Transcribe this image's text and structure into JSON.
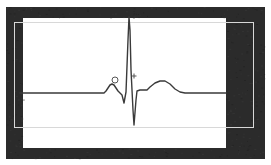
{
  "display": {
    "title": "ECG Waveform Trace",
    "width": 271,
    "height": 165,
    "background_color": "#ffffff",
    "frame_color": "#2b2b2b",
    "guide_color": "#d8d8d8",
    "trace_color": "#3a3a3a",
    "marker_color": "#555555"
  },
  "frame": {
    "name": "dark-border-frame",
    "outer_rect": {
      "x": 6,
      "y": 7,
      "width": 259,
      "height": 152
    },
    "top_bar_thickness": 11,
    "bottom_bar_thickness": 11,
    "left_bar_thickness": 17,
    "right_bar_thickness": 39
  },
  "guide_rect": {
    "name": "inner-guide-rectangle",
    "x": 14,
    "y": 22,
    "width": 239,
    "height": 105,
    "stroke_width": 1
  },
  "markers": [
    {
      "name": "circle-marker",
      "symbol": "circle",
      "x": 115,
      "y": 80,
      "radius": 3
    },
    {
      "name": "plus-marker",
      "symbol": "plus",
      "x": 134,
      "y": 76,
      "size": 5
    }
  ],
  "chart_data": {
    "type": "line",
    "title": "ECG Waveform Trace",
    "subtitle": "Single PQRST complex",
    "xlabel": "",
    "ylabel": "",
    "xlim": [
      0,
      271
    ],
    "ylim": [
      0,
      165
    ],
    "grid": false,
    "legend": null,
    "baseline_y": 93,
    "annotations": [
      {
        "label": "circle-marker",
        "x": 115,
        "y": 80
      },
      {
        "label": "plus-marker",
        "x": 134,
        "y": 76
      }
    ],
    "features": [
      {
        "name": "isoelectric-baseline-left",
        "start_x": 20,
        "end_x": 104,
        "y": 93
      },
      {
        "name": "p-wave",
        "peak_x": 112,
        "peak_y": 84,
        "start_x": 104,
        "end_x": 120
      },
      {
        "name": "q-wave",
        "trough_x": 124,
        "trough_y": 103
      },
      {
        "name": "r-wave",
        "peak_x": 129,
        "peak_y": 17
      },
      {
        "name": "s-wave",
        "trough_x": 134,
        "trough_y": 125
      },
      {
        "name": "st-segment",
        "start_x": 138,
        "end_x": 147,
        "y": 90
      },
      {
        "name": "t-wave",
        "peak_x": 163,
        "peak_y": 81,
        "start_x": 147,
        "end_x": 180
      },
      {
        "name": "isoelectric-baseline-right",
        "start_x": 180,
        "end_x": 226,
        "y": 93
      }
    ],
    "series": [
      {
        "name": "ecg-trace",
        "color": "#3a3a3a",
        "points": [
          [
            20,
            93
          ],
          [
            60,
            93
          ],
          [
            100,
            93
          ],
          [
            104,
            93
          ],
          [
            106,
            91
          ],
          [
            108,
            88
          ],
          [
            110,
            85
          ],
          [
            112,
            84
          ],
          [
            114,
            85
          ],
          [
            116,
            88
          ],
          [
            118,
            91
          ],
          [
            120,
            93
          ],
          [
            122,
            95
          ],
          [
            124,
            103
          ],
          [
            126,
            92
          ],
          [
            128,
            40
          ],
          [
            129,
            17
          ],
          [
            130,
            30
          ],
          [
            131,
            70
          ],
          [
            133,
            110
          ],
          [
            134,
            125
          ],
          [
            136,
            100
          ],
          [
            137,
            91
          ],
          [
            140,
            90
          ],
          [
            147,
            90
          ],
          [
            150,
            87
          ],
          [
            155,
            83
          ],
          [
            160,
            81
          ],
          [
            165,
            81
          ],
          [
            170,
            84
          ],
          [
            175,
            89
          ],
          [
            180,
            92
          ],
          [
            185,
            93
          ],
          [
            200,
            93
          ],
          [
            215,
            93
          ],
          [
            226,
            93
          ]
        ]
      }
    ]
  }
}
